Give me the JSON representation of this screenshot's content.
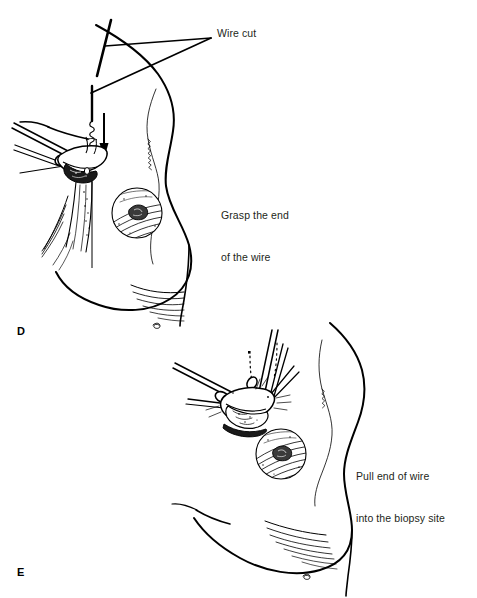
{
  "figure": {
    "background_color": "#ffffff",
    "ink_color": "#000000",
    "text_color": "#231f20",
    "width": 477,
    "height": 598
  },
  "panels": [
    {
      "letter": "D",
      "caption": "Grasp the end\nof the wire",
      "annotations": [
        "Wire cut"
      ]
    },
    {
      "letter": "E",
      "caption": "Pull end of wire\ninto the biopsy site",
      "annotations": []
    }
  ],
  "labels": {
    "wire_cut": "Wire cut",
    "grasp_line1": "Grasp the end",
    "grasp_line2": "of the wire",
    "pull_line1": "Pull end of wire",
    "pull_line2": "into the biopsy site",
    "panel_d": "D",
    "panel_e": "E"
  },
  "graphics": {
    "breast_outline_d": "breast-profile-outline",
    "breast_outline_e": "breast-profile-outline",
    "areola_d": "areola-nipple",
    "areola_e": "areola-nipple",
    "clamp_d": "hemostat-clamp-icon",
    "clamp_e": "hemostat-clamp-icon",
    "cut_wire_segment": "cut-wire-segment",
    "wire_stub": "localization-wire-stub",
    "direction_arrow": "down-arrow-icon",
    "leader_lines": "leader-line",
    "inframammary_fold_d": "inframammary-fold-hatching",
    "inframammary_fold_e": "inframammary-fold-hatching",
    "dotted_wire_trail": "dotted-wire-trail"
  }
}
